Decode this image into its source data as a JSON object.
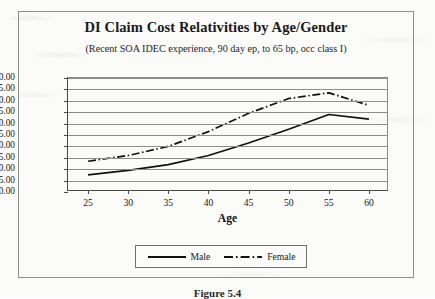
{
  "figure": {
    "title": "DI Claim Cost Relativities by Age/Gender",
    "subtitle": "(Recent SOA IDEC experience, 90 day ep, to 65 bp,  occ class I)",
    "caption": "Figure 5.4"
  },
  "legend": {
    "items": [
      {
        "label": "Male",
        "style": "solid"
      },
      {
        "label": "Female",
        "style": "dash-dot"
      }
    ]
  },
  "chart_data": {
    "type": "line",
    "title": "DI Claim Cost Relativities by Age/Gender",
    "subtitle": "(Recent SOA IDEC experience, 90 day ep, to 65 bp,  occ class I)",
    "xlabel": "Age",
    "ylabel": "",
    "x": [
      25,
      30,
      35,
      40,
      45,
      50,
      55,
      60
    ],
    "xlim": [
      22.5,
      62.5
    ],
    "ylim": [
      0,
      50
    ],
    "xticks": [
      25,
      30,
      35,
      40,
      45,
      50,
      55,
      60
    ],
    "yticks": [
      0,
      5,
      10,
      15,
      20,
      25,
      30,
      35,
      40,
      45,
      50
    ],
    "ytick_labels": [
      "0.00",
      "5.00",
      "10.00",
      "15.00",
      "20.00",
      "25.00",
      "30.00",
      "35.00",
      "40.00",
      "45.00",
      "50.00"
    ],
    "grid": "horizontal",
    "legend_position": "bottom",
    "series": [
      {
        "name": "Male",
        "style": "solid",
        "values": [
          7.5,
          9.5,
          12.0,
          16.0,
          21.5,
          27.5,
          34.0,
          32.0
        ]
      },
      {
        "name": "Female",
        "style": "dash-dot",
        "values": [
          13.5,
          16.0,
          20.0,
          26.5,
          34.5,
          41.0,
          43.5,
          38.0
        ]
      }
    ]
  },
  "colors": {
    "line": "#111111",
    "grid": "#8d8d8d",
    "axis": "#4a4a4a",
    "page": "#fbfbf9"
  }
}
